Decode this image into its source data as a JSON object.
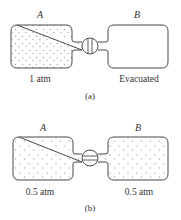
{
  "figure_a": {
    "container_a_label": "A",
    "container_b_label": "B",
    "container_a_pressure": "1 atm",
    "container_b_state": "Evacuated",
    "valve_state": "closed",
    "caption": "(a)",
    "container_a_filled": true,
    "container_b_filled": false
  },
  "figure_b": {
    "container_a_label": "A",
    "container_b_label": "B",
    "container_a_pressure": "0.5 atm",
    "container_b_pressure": "0.5 atm",
    "valve_state": "open",
    "caption": "(b)",
    "container_a_filled": true,
    "container_b_filled": true
  },
  "colors": {
    "outline": "#4a4a4a",
    "gas_dots": "#a8a8a8",
    "text": "#333333"
  }
}
